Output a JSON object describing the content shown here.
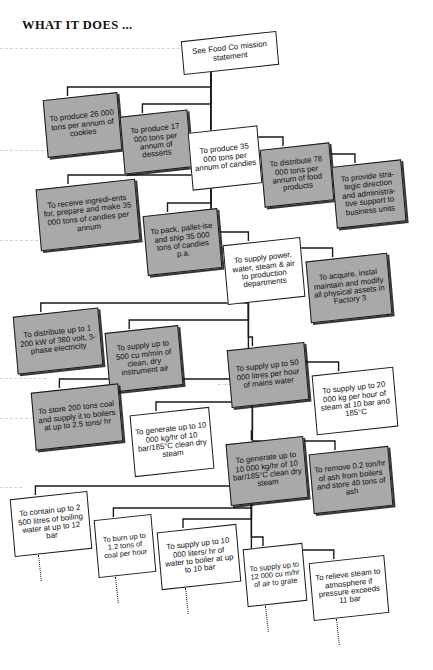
{
  "header": {
    "title": "WHAT IT DOES ..."
  },
  "diagram": {
    "type": "hierarchy-tree",
    "style_note": "skewed scanned organisation / function deployment chart",
    "colors": {
      "box_fill_gray": "#a9a9a9",
      "box_fill_white": "#ffffff",
      "box_border": "#1a1a1a",
      "connector": "#1a1a1a",
      "scanline": "#cfcfcf"
    },
    "nodes": [
      {
        "id": "n0",
        "text": "See Food Co mission statement",
        "fill": "white",
        "level": 0,
        "x": 182,
        "y": 36,
        "w": 96,
        "h": 34
      },
      {
        "id": "n1",
        "text": "To produce 26 000 tons per annum of cookies",
        "fill": "gray",
        "level": 1,
        "x": 45,
        "y": 96,
        "w": 75,
        "h": 58
      },
      {
        "id": "n2",
        "text": "To produce 17 000 tons per annum of desserts",
        "fill": "gray",
        "level": 1,
        "x": 122,
        "y": 113,
        "w": 68,
        "h": 58
      },
      {
        "id": "n3",
        "text": "To produce 35 000 tons per annum of candies",
        "fill": "white",
        "level": 1,
        "x": 190,
        "y": 129,
        "w": 70,
        "h": 58
      },
      {
        "id": "n4",
        "text": "To distribute 78 000 tons per annum of food products",
        "fill": "gray",
        "level": 1,
        "x": 262,
        "y": 146,
        "w": 70,
        "h": 58
      },
      {
        "id": "n5",
        "text": "To provide stra-tegic direction and administra-tive support to business units",
        "fill": "gray",
        "level": 1,
        "x": 334,
        "y": 163,
        "w": 70,
        "h": 62
      },
      {
        "id": "n6",
        "text": "To receive ingredi-ents for, prepare and make 35 000 tons of candies per annum",
        "fill": "gray",
        "level": 2,
        "x": 38,
        "y": 184,
        "w": 100,
        "h": 62
      },
      {
        "id": "n7",
        "text": "To pack, pallet-ise and ship 35 000 tons of candies p.a.",
        "fill": "gray",
        "level": 2,
        "x": 145,
        "y": 212,
        "w": 75,
        "h": 60
      },
      {
        "id": "n8",
        "text": "To supply power, water, steam & air to production departments",
        "fill": "white",
        "level": 2,
        "x": 225,
        "y": 241,
        "w": 78,
        "h": 60
      },
      {
        "id": "n9",
        "text": "To acquire, instal maintain and modify all physical assets in Factory 3",
        "fill": "gray",
        "level": 2,
        "x": 308,
        "y": 257,
        "w": 82,
        "h": 62
      },
      {
        "id": "n10",
        "text": "To distribute up to 1 200 kW of 380 volt, 3-phase electricity",
        "fill": "gray",
        "level": 3,
        "x": 15,
        "y": 312,
        "w": 86,
        "h": 58
      },
      {
        "id": "n11",
        "text": "To supply up to 500 cu m/min of clean, dry instrument air",
        "fill": "gray",
        "level": 3,
        "x": 107,
        "y": 329,
        "w": 74,
        "h": 60
      },
      {
        "id": "n12",
        "text": "To supply up to 50 000 litres per hour of mains water",
        "fill": "gray",
        "level": 3,
        "x": 229,
        "y": 346,
        "w": 78,
        "h": 58
      },
      {
        "id": "n13",
        "text": "To supply up to 20 000 kg per hour of steam at 10 bar and 185°C",
        "fill": "white",
        "level": 3,
        "x": 314,
        "y": 371,
        "w": 82,
        "h": 60
      },
      {
        "id": "n14",
        "text": "To store 200 tons coal and supply it to boilers at up to 2.5 tons/ hr",
        "fill": "gray",
        "level": 4,
        "x": 33,
        "y": 388,
        "w": 88,
        "h": 58
      },
      {
        "id": "n15",
        "text": "To generate up to 10 000 kg/hr of 10 bar/185°C clean dry steam",
        "fill": "white",
        "level": 4,
        "x": 132,
        "y": 411,
        "w": 80,
        "h": 62
      },
      {
        "id": "n16",
        "text": "To generate up to 10 000 kg/hr of 10 bar/185°C clean dry steam",
        "fill": "gray",
        "level": 4,
        "x": 228,
        "y": 440,
        "w": 78,
        "h": 62
      },
      {
        "id": "n17",
        "text": "To remove 0.2 ton/hr of ash from boilers and store 40 tons of ash",
        "fill": "gray",
        "level": 4,
        "x": 311,
        "y": 450,
        "w": 80,
        "h": 60
      },
      {
        "id": "n18",
        "text": "To contain up to 2 500 litres of boiling water at up to 12 bar",
        "fill": "white",
        "level": 5,
        "x": 12,
        "y": 495,
        "w": 78,
        "h": 58
      },
      {
        "id": "n19",
        "text": "To burn up to 1.2 tons of coal per hour",
        "fill": "white",
        "level": 5,
        "x": 96,
        "y": 517,
        "w": 58,
        "h": 58
      },
      {
        "id": "n20",
        "text": "To supply up to 10 000 liters/ hr of water to boiler at up to 10 bar",
        "fill": "white",
        "level": 5,
        "x": 159,
        "y": 528,
        "w": 80,
        "h": 58
      },
      {
        "id": "n21",
        "text": "To supply up to 12 000 cu m/hr of air to grate",
        "fill": "white",
        "level": 5,
        "x": 245,
        "y": 546,
        "w": 60,
        "h": 58
      },
      {
        "id": "n22",
        "text": "To relieve steam to atmosphere if pressure exceeds 11 bar",
        "fill": "white",
        "level": 5,
        "x": 311,
        "y": 559,
        "w": 76,
        "h": 58
      }
    ],
    "edges": [
      {
        "from": "n0",
        "to": "n1"
      },
      {
        "from": "n0",
        "to": "n2"
      },
      {
        "from": "n0",
        "to": "n3"
      },
      {
        "from": "n0",
        "to": "n4"
      },
      {
        "from": "n0",
        "to": "n5"
      },
      {
        "from": "n3",
        "to": "n6"
      },
      {
        "from": "n3",
        "to": "n7"
      },
      {
        "from": "n3",
        "to": "n8"
      },
      {
        "from": "n3",
        "to": "n9"
      },
      {
        "from": "n8",
        "to": "n10"
      },
      {
        "from": "n8",
        "to": "n11"
      },
      {
        "from": "n8",
        "to": "n12"
      },
      {
        "from": "n8",
        "to": "n13"
      },
      {
        "from": "n12",
        "to": "n14"
      },
      {
        "from": "n12",
        "to": "n15"
      },
      {
        "from": "n12",
        "to": "n16"
      },
      {
        "from": "n12",
        "to": "n17"
      },
      {
        "from": "n16",
        "to": "n18"
      },
      {
        "from": "n16",
        "to": "n19"
      },
      {
        "from": "n16",
        "to": "n20"
      },
      {
        "from": "n16",
        "to": "n21"
      },
      {
        "from": "n16",
        "to": "n22"
      }
    ],
    "continuation_markers": [
      {
        "under": "n18"
      },
      {
        "under": "n19"
      },
      {
        "under": "n20"
      },
      {
        "under": "n21"
      },
      {
        "under": "n22"
      }
    ]
  }
}
